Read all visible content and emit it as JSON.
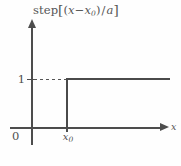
{
  "figure": {
    "background_color": "#fefefe",
    "line_color": "#4a4a4a",
    "axis_color": "#4d4d4d",
    "text_color": "#4f4f4f",
    "width": 181,
    "height": 166
  },
  "labels": {
    "y_axis_expression": {
      "function_name": "step",
      "open_bracket": "[",
      "open_paren": "(",
      "variable": "x",
      "minus": "−",
      "shift_variable": "x",
      "shift_subscript": "0",
      "close_paren": ")",
      "divide": "/",
      "denominator": "a",
      "close_bracket": "]"
    },
    "x_axis_label": "x",
    "origin_label": "0",
    "y_tick_label": "1",
    "x_tick_label_base": "x",
    "x_tick_label_subscript": "0",
    "caption_remnant": ""
  },
  "chart_data": {
    "type": "line",
    "xlabel": "x",
    "ylabel": "step[(x−x₀) / a]",
    "x": [
      "0",
      "x₀",
      "x₀",
      "max"
    ],
    "y": [
      0,
      0,
      1,
      1
    ],
    "xlim": [
      "0",
      "max"
    ],
    "ylim": [
      0,
      1.45
    ],
    "xticks": [
      "0",
      "x₀"
    ],
    "yticks": [
      "1"
    ],
    "ytick_values": [
      1
    ],
    "grid": false,
    "legend": null,
    "annotations": [
      {
        "text": "dashed guide line from y-axis to step corner at y = 1",
        "y": 1,
        "style": "dashed"
      }
    ],
    "series": [
      {
        "name": "step[(x−x₀) / a]",
        "points": [
          {
            "x": "0",
            "y": 0
          },
          {
            "x": "x₀",
            "y": 0
          },
          {
            "x": "x₀",
            "y": 1
          },
          {
            "x": "max",
            "y": 1
          }
        ]
      }
    ]
  }
}
